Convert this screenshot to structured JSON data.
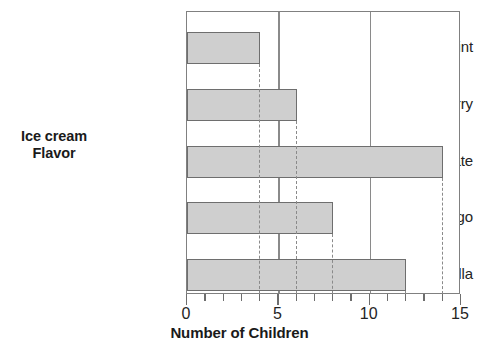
{
  "chart_data": {
    "type": "bar",
    "orientation": "horizontal",
    "title": "",
    "xlabel": "Number of Children",
    "ylabel": "Ice cream Flavor",
    "categories": [
      "Mint",
      "Strawberry",
      "Chocolate",
      "Mango",
      "Vanilla"
    ],
    "values": [
      4,
      6,
      14,
      8,
      12
    ],
    "xlim": [
      0,
      15
    ],
    "xticks": [
      0,
      1,
      2,
      3,
      4,
      5,
      6,
      7,
      8,
      9,
      10,
      11,
      12,
      13,
      14,
      15
    ],
    "xtick_labels": [
      "0",
      "5",
      "10",
      "15"
    ],
    "xtick_label_values": [
      0,
      5,
      10,
      15
    ],
    "gridlines": [
      5,
      10
    ],
    "grid": true,
    "legend": "none",
    "bar_fill_color": "#cfcfcf",
    "bar_edge_color": "#6e6e6e",
    "gridline_color": "#8a8a8a",
    "leader_line_style": "dashed",
    "leader_lines": [
      4,
      6,
      14,
      8,
      12
    ],
    "background_color": "#ffffff",
    "text_color": "#242424"
  },
  "axis": {
    "y_title_line1": "Ice cream",
    "y_title_line2": "Flavor",
    "x_title": "Number of Children"
  },
  "x_labels": [
    {
      "text": "0",
      "value": 0
    },
    {
      "text": "5",
      "value": 5
    },
    {
      "text": "10",
      "value": 10
    },
    {
      "text": "15",
      "value": 15
    }
  ],
  "bars": [
    {
      "label": "Mint",
      "value": 4
    },
    {
      "label": "Strawberry",
      "value": 6
    },
    {
      "label": "Chocolate",
      "value": 14
    },
    {
      "label": "Mango",
      "value": 8
    },
    {
      "label": "Vanilla",
      "value": 12
    }
  ]
}
